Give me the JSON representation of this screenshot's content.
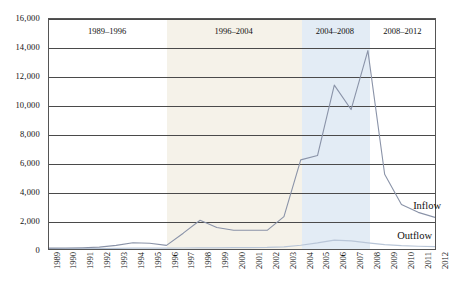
{
  "chart_data": {
    "type": "line",
    "title": "",
    "subtitle": "",
    "xlabel": "",
    "ylabel": "",
    "grid": true,
    "legend_position": "right-inline",
    "ylim": [
      0,
      16000
    ],
    "ytick_values": [
      0,
      2000,
      4000,
      6000,
      8000,
      10000,
      12000,
      14000,
      16000
    ],
    "ytick_labels": [
      "0",
      "2,000",
      "4,000",
      "6,000",
      "8,000",
      "10,000",
      "12,000",
      "14,000",
      "16,000"
    ],
    "x": [
      1989,
      1990,
      1991,
      1992,
      1993,
      1994,
      1995,
      1996,
      1997,
      1998,
      1999,
      2000,
      2001,
      2002,
      2003,
      2004,
      2005,
      2006,
      2007,
      2008,
      2009,
      2010,
      2011,
      2012
    ],
    "xtick_labels": [
      "1989",
      "1990",
      "1991",
      "1992",
      "1993",
      "1994",
      "1995",
      "1996",
      "1997",
      "1998",
      "1999",
      "2000",
      "2001",
      "2002",
      "2003",
      "2004",
      "2005",
      "2006",
      "2007",
      "2008",
      "2009",
      "2010",
      "2011",
      "2012"
    ],
    "series": [
      {
        "name": "Inflow",
        "color": "#8a93a8",
        "values": [
          60,
          70,
          90,
          130,
          250,
          430,
          400,
          250,
          1100,
          2000,
          1500,
          1300,
          1300,
          1300,
          2250,
          6200,
          6500,
          11400,
          9700,
          13800,
          5200,
          3100,
          2550,
          2200
        ]
      },
      {
        "name": "Outflow",
        "color": "#b9c6d8",
        "values": [
          20,
          25,
          30,
          35,
          45,
          55,
          60,
          65,
          70,
          80,
          85,
          90,
          95,
          110,
          150,
          260,
          420,
          620,
          560,
          430,
          300,
          230,
          190,
          170
        ]
      }
    ],
    "period_bands": [
      {
        "label": "1989–1996",
        "start": 1989,
        "end": 1996,
        "color": "#ffffff"
      },
      {
        "label": "1996–2004",
        "start": 1996,
        "end": 2004,
        "color": "#f5f2e9"
      },
      {
        "label": "2004–2008",
        "start": 2004,
        "end": 2008,
        "color": "#e3ecf5"
      },
      {
        "label": "2008–2012",
        "start": 2008,
        "end": 2012,
        "color": "#ffffff"
      }
    ],
    "annotations": [
      {
        "text": "Inflow",
        "x": 2011,
        "y": 3000
      },
      {
        "text": "Outflow",
        "x": 2011,
        "y": 900
      }
    ]
  }
}
